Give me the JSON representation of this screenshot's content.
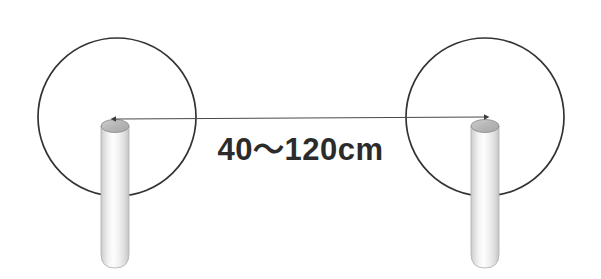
{
  "figure": {
    "background_color": "#ffffff",
    "width": 601,
    "height": 279,
    "stroke_color": "#333333",
    "text_color": "#2b2b2b",
    "dimension_label": "40～120cm"
  },
  "annotation": {
    "dimension_text": "40～120cm",
    "min_value": "40",
    "max_value": "120",
    "unit": "cm",
    "range_separator": "～"
  },
  "elements": {
    "left_circle": {
      "name": "left-coverage-circle",
      "center_x": 117,
      "center_y": 117,
      "radius": 79
    },
    "right_circle": {
      "name": "right-coverage-circle",
      "center_x": 485,
      "center_y": 117,
      "radius": 79
    },
    "left_post": {
      "name": "left-cylinder-post",
      "x": 101,
      "top_y": 119,
      "width": 28,
      "height": 149
    },
    "right_post": {
      "name": "right-cylinder-post",
      "x": 471,
      "top_y": 119,
      "width": 28,
      "height": 149
    },
    "measure_arrow": {
      "name": "spacing-measure-arrow",
      "from_x": 115,
      "to_x": 485,
      "y": 118
    }
  },
  "colors": {
    "outline": "#333333",
    "cylinder_body_light": "#fdfdfd",
    "cylinder_body_mid": "#e4e4e4",
    "cylinder_body_edge": "#c9c9c9",
    "cylinder_cap": "#bdbdbd",
    "cylinder_cap_edge": "#9a9a9a",
    "arrow": "#4a4a4a",
    "text": "#2b2b2b"
  }
}
